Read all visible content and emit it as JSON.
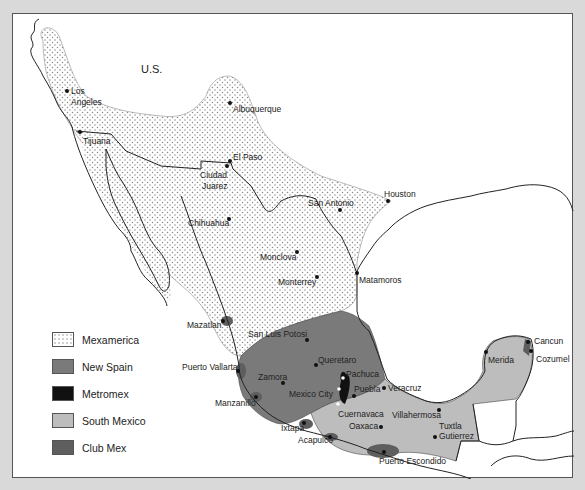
{
  "map": {
    "country_label": "U.S.",
    "regions": [
      {
        "id": "mexamerica",
        "name": "Mexamerica",
        "color": "#f4f4f4",
        "pattern": "dotted"
      },
      {
        "id": "new-spain",
        "name": "New Spain",
        "color": "#7a7a7a"
      },
      {
        "id": "metromex",
        "name": "Metromex",
        "color": "#111111"
      },
      {
        "id": "south-mexico",
        "name": "South Mexico",
        "color": "#bdbdbd"
      },
      {
        "id": "club-mex",
        "name": "Club Mex",
        "color": "#5e5e5e"
      }
    ],
    "legend": [
      {
        "label": "Mexamerica"
      },
      {
        "label": "New Spain"
      },
      {
        "label": "Metromex"
      },
      {
        "label": "South Mexico"
      },
      {
        "label": "Club Mex"
      }
    ],
    "cities": [
      {
        "name": "Los Angeles",
        "lines": [
          "Los",
          "Angeles"
        ]
      },
      {
        "name": "Albuquerque"
      },
      {
        "name": "Tijuana"
      },
      {
        "name": "El Paso"
      },
      {
        "name": "Ciudad Juarez",
        "lines": [
          "Ciudad",
          "Juarez"
        ]
      },
      {
        "name": "Houston"
      },
      {
        "name": "San Antonio"
      },
      {
        "name": "Chihuahua"
      },
      {
        "name": "Monclova"
      },
      {
        "name": "Monterrey"
      },
      {
        "name": "Matamoros"
      },
      {
        "name": "Mazatlan"
      },
      {
        "name": "San Luis Potosi"
      },
      {
        "name": "Cancun"
      },
      {
        "name": "Cozumel"
      },
      {
        "name": "Merida"
      },
      {
        "name": "Puerto Vallarta"
      },
      {
        "name": "Queretaro"
      },
      {
        "name": "Pachuca"
      },
      {
        "name": "Zamora"
      },
      {
        "name": "Mexico City"
      },
      {
        "name": "Puebla"
      },
      {
        "name": "Veracruz"
      },
      {
        "name": "Manzanillo"
      },
      {
        "name": "Cuernavaca"
      },
      {
        "name": "Villahermosa"
      },
      {
        "name": "Oaxaca"
      },
      {
        "name": "Tuxtla Gutierrez",
        "lines": [
          "Tuxtla",
          "Gutierrez"
        ]
      },
      {
        "name": "Ixtapa"
      },
      {
        "name": "Acapulco"
      },
      {
        "name": "Puerto Escondido"
      }
    ]
  }
}
